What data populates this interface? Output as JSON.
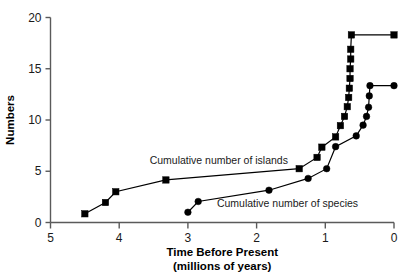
{
  "chart_data": {
    "type": "line",
    "title": "",
    "xlabel": "Time Before Present",
    "xlabel_sub": "(millions of years)",
    "ylabel": "Numbers",
    "xlim": [
      5,
      0
    ],
    "ylim": [
      0,
      20
    ],
    "x_reversed": true,
    "grid": false,
    "legend": "inline-annotations",
    "xticks": [
      5,
      4,
      3,
      2,
      1,
      0
    ],
    "xticklabels": [
      "5",
      "4",
      "3",
      "2",
      "1",
      "0"
    ],
    "yticks": [
      0,
      5,
      10,
      15,
      20
    ],
    "yticklabels": [
      "0",
      "5",
      "10",
      "15",
      "20"
    ],
    "annotations": [
      {
        "text": "Cumulative number of islands",
        "x": 2.55,
        "y": 6.05
      },
      {
        "text": "Cumulative number of species",
        "x": 1.55,
        "y": 1.9
      }
    ],
    "series": [
      {
        "name": "Cumulative number of islands",
        "marker": "square",
        "color": "#000000",
        "points": [
          [
            4.5,
            0.85
          ],
          [
            4.2,
            1.95
          ],
          [
            4.05,
            3.0
          ],
          [
            3.32,
            4.15
          ],
          [
            1.38,
            5.25
          ],
          [
            1.12,
            6.35
          ],
          [
            1.05,
            7.35
          ],
          [
            0.85,
            8.35
          ],
          [
            0.78,
            9.45
          ],
          [
            0.72,
            10.35
          ],
          [
            0.68,
            11.3
          ],
          [
            0.66,
            12.2
          ],
          [
            0.65,
            13.1
          ],
          [
            0.64,
            14.05
          ],
          [
            0.64,
            15.0
          ],
          [
            0.63,
            15.95
          ],
          [
            0.63,
            16.9
          ],
          [
            0.62,
            18.3
          ],
          [
            0.0,
            18.3
          ]
        ]
      },
      {
        "name": "Cumulative number of species",
        "marker": "circle",
        "color": "#000000",
        "points": [
          [
            3.0,
            1.0
          ],
          [
            2.85,
            2.05
          ],
          [
            1.82,
            3.15
          ],
          [
            1.25,
            4.3
          ],
          [
            0.98,
            5.25
          ],
          [
            0.85,
            7.4
          ],
          [
            0.55,
            8.45
          ],
          [
            0.45,
            9.5
          ],
          [
            0.4,
            10.35
          ],
          [
            0.37,
            11.25
          ],
          [
            0.36,
            12.35
          ],
          [
            0.35,
            13.35
          ],
          [
            0.0,
            13.35
          ]
        ]
      }
    ]
  }
}
